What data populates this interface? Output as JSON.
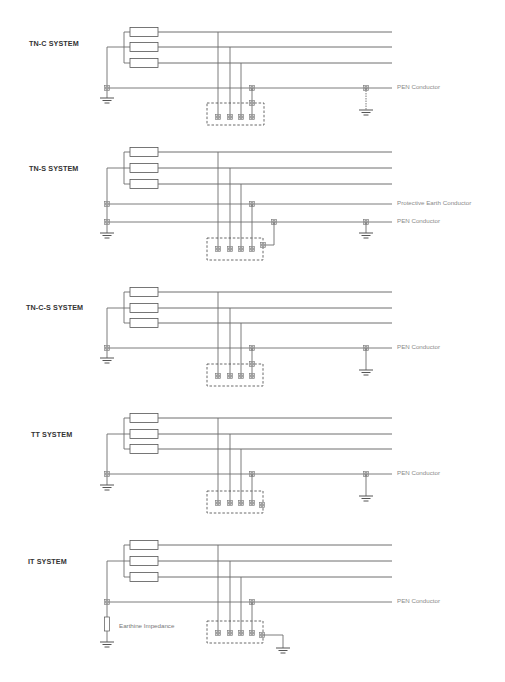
{
  "header": {
    "cut_text": ""
  },
  "colors": {
    "line": "#6e6e6e",
    "box_stroke": "#555555",
    "terminal_fill": "#d8d8d8",
    "label": "#8a8a8a",
    "title": "#333333"
  },
  "systems": [
    {
      "title": "TN-C SYSTEM",
      "title_pos": [
        29,
        43
      ],
      "rows": [
        32,
        47,
        63
      ],
      "pen_y": 88,
      "pe_y": null,
      "source_ground_y": 98,
      "box": [
        207,
        103,
        57,
        22
      ],
      "terminal_y": 117,
      "pen_label": "PEN Conductor",
      "pe_label": null,
      "variant": "tnc"
    },
    {
      "title": "TN-S SYSTEM",
      "title_pos": [
        29,
        168
      ],
      "rows": [
        152,
        168,
        184
      ],
      "pen_y": 222,
      "pe_y": 204,
      "source_ground_y": 233,
      "box": [
        207,
        238,
        56,
        22
      ],
      "terminal_y": 249,
      "pen_label": "PEN Conductor",
      "pe_label": "Protective Earth Conductor",
      "variant": "tns"
    },
    {
      "title": "TN-C-S SYSTEM",
      "title_pos": [
        26,
        307
      ],
      "rows": [
        292,
        308,
        323
      ],
      "pen_y": 348,
      "pe_y": null,
      "source_ground_y": 358,
      "box": [
        207,
        364,
        56,
        22
      ],
      "terminal_y": 376,
      "pen_label": "PEN Conductor",
      "pe_label": null,
      "variant": "tncs"
    },
    {
      "title": "TT SYSTEM",
      "title_pos": [
        31,
        434
      ],
      "rows": [
        418,
        434,
        449
      ],
      "pen_y": 474,
      "pe_y": null,
      "source_ground_y": 485,
      "box": [
        207,
        491,
        56,
        22
      ],
      "terminal_y": 503,
      "pen_label": "PEN Conductor",
      "pe_label": null,
      "variant": "tt"
    },
    {
      "title": "IT SYSTEM",
      "title_pos": [
        28,
        561
      ],
      "rows": [
        545,
        561,
        577
      ],
      "pen_y": 602,
      "pe_y": null,
      "source_ground_y": 642,
      "box": [
        207,
        621,
        56,
        22
      ],
      "terminal_y": 633,
      "pen_label": "PEN Conductor",
      "pe_label": null,
      "impedance_label": "Earthine Impedance",
      "variant": "it"
    }
  ]
}
